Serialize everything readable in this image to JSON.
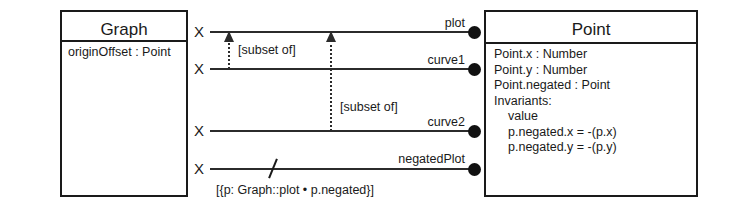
{
  "diagram": {
    "type": "uml-class-diagram",
    "classes": [
      {
        "name": "Graph",
        "attributes": [
          {
            "text": "originOffset : Point",
            "indent": 0
          }
        ]
      },
      {
        "name": "Point",
        "attributes": [
          {
            "text": "Point.x : Number",
            "indent": 0
          },
          {
            "text": "Point.y : Number",
            "indent": 0
          },
          {
            "text": "Point.negated : Point",
            "indent": 0
          },
          {
            "text": "Invariants:",
            "indent": 0
          },
          {
            "text": "value",
            "indent": 1
          },
          {
            "text": "p.negated.x = -(p.x)",
            "indent": 1
          },
          {
            "text": "p.negated.y = -(p.y)",
            "indent": 1
          }
        ]
      }
    ],
    "associations": [
      {
        "role_name": "plot",
        "source_multiplicity": "X",
        "derived": false
      },
      {
        "role_name": "curve1",
        "source_multiplicity": "X",
        "derived": false
      },
      {
        "role_name": "curve2",
        "source_multiplicity": "X",
        "derived": false
      },
      {
        "role_name": "negatedPlot",
        "source_multiplicity": "X",
        "derived": true
      }
    ],
    "subset_constraints": [
      {
        "label": "[subset of]",
        "from_role": "curve1",
        "to_role": "plot"
      },
      {
        "label": "[subset of]",
        "from_role": "curve2",
        "to_role": "plot"
      }
    ],
    "derivation_constraint": "[{p: Graph::plot • p.negated}]",
    "colors": {
      "line": "#2b2b2b",
      "border": "#1a1a1a",
      "text": "#1a1a1a",
      "dot_fill": "#111111",
      "background": "#ffffff"
    }
  }
}
